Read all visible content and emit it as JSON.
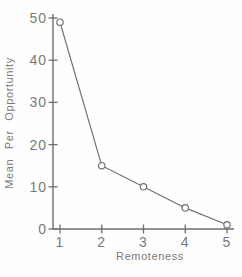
{
  "figure": {
    "background": "#fefefe",
    "ink_color": "#6f6f6f",
    "text_color": "#7a7a7a",
    "marker_fill": "#ffffff"
  },
  "chart_data": {
    "type": "line",
    "title": "",
    "xlabel": "Remoteness",
    "ylabel": "Mean Per Opportunity",
    "x": [
      1,
      2,
      3,
      4,
      5
    ],
    "values": [
      49,
      15,
      10,
      5,
      1
    ],
    "x_tick_labels": [
      "1",
      "2",
      "3",
      "4",
      "5"
    ],
    "y_tick_values": [
      0,
      10,
      20,
      30,
      40,
      50
    ],
    "xlim": [
      1,
      5
    ],
    "ylim": [
      0,
      50
    ],
    "marker": "open-circle",
    "line_style": "solid",
    "grid": false,
    "legend_position": "none"
  }
}
